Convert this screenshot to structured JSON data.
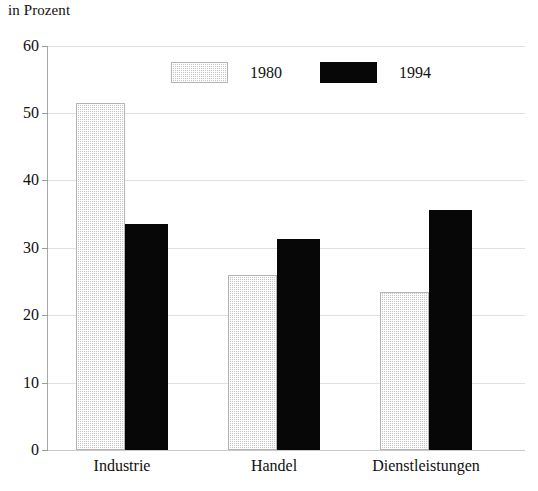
{
  "chart_data": {
    "type": "bar",
    "title": "",
    "subtitle": "",
    "unit_label": "in Prozent",
    "xlabel": "",
    "ylabel": "",
    "categories": [
      "Industrie",
      "Handel",
      "Dienstleistungen"
    ],
    "series": [
      {
        "name": "1980",
        "values": [
          51.5,
          26.0,
          23.5
        ],
        "color": "#c6c6c6",
        "fill": "dotted-light-gray"
      },
      {
        "name": "1994",
        "values": [
          33.6,
          31.4,
          35.6
        ],
        "color": "#070707",
        "fill": "solid-black"
      }
    ],
    "ylim": [
      0,
      60
    ],
    "yticks": [
      0,
      10,
      20,
      30,
      40,
      50,
      60
    ],
    "ytick_labels": [
      "0",
      "10",
      "20",
      "30",
      "40",
      "50",
      "60"
    ],
    "grid": true,
    "grid_axis": "y",
    "legend": [
      "1980",
      "1994"
    ],
    "legend_position": "top-center"
  },
  "legend": {
    "items": [
      {
        "label": "1980",
        "swatch": "legend-swatch-1980"
      },
      {
        "label": "1994",
        "swatch": "legend-swatch-1994"
      }
    ]
  },
  "axis": {
    "unit_caption": "in Prozent",
    "y_ticks": [
      "60",
      "50",
      "40",
      "30",
      "20",
      "10",
      "0"
    ],
    "x_categories": [
      "Industrie",
      "Handel",
      "Dienstleistungen"
    ]
  },
  "colors": {
    "series_1980": "#c6c6c6",
    "series_1994": "#070707",
    "gridline": "#e0e0e0",
    "axis": "#a9a9a9",
    "background": "#ffffff",
    "text": "#101010"
  }
}
